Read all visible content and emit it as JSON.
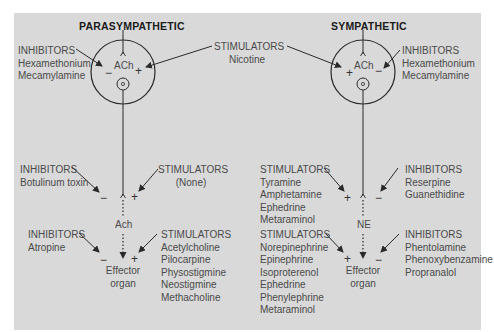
{
  "colors": {
    "panel": "#d9d9d9",
    "line": "#2a2a2a",
    "text": "#4a4a4a",
    "title": "#1a1a1a"
  },
  "parasympathetic": {
    "title": "PARASYMPATHETIC",
    "ganglion": {
      "transmitter": "ACh",
      "inhibitors": {
        "label": "INHIBITORS",
        "items": [
          "Hexamethonium",
          "Mecamylamine"
        ],
        "sign": "−"
      },
      "stimulator_sign": "+"
    },
    "postganglionic": {
      "inhibitors": {
        "label": "INHIBITORS",
        "items": [
          "Botulinum toxin"
        ],
        "sign": "−"
      },
      "stimulators": {
        "label": "STIMULATORS",
        "items": [
          "(None)"
        ],
        "sign": "+"
      },
      "transmitter": "Ach"
    },
    "effector": {
      "label_line1": "Effector",
      "label_line2": "organ",
      "inhibitors": {
        "label": "INHIBITORS",
        "items": [
          "Atropine"
        ],
        "sign": "−"
      },
      "stimulators": {
        "label": "STIMULATORS",
        "items": [
          "Acetylcholine",
          "Pilocarpine",
          "Physostigmine",
          "Neostigmine",
          "Methacholine"
        ],
        "sign": "+"
      }
    }
  },
  "shared_ganglion_stimulators": {
    "label": "STIMULATORS",
    "items": [
      "Nicotine"
    ]
  },
  "sympathetic": {
    "title": "SYMPATHETIC",
    "ganglion": {
      "transmitter": "ACh",
      "inhibitors": {
        "label": "INHIBITORS",
        "items": [
          "Hexamethonium",
          "Mecamylamine"
        ],
        "sign": "−"
      },
      "stimulator_sign": "+"
    },
    "postganglionic": {
      "stimulators": {
        "label": "STIMULATORS",
        "items": [
          "Tyramine",
          "Amphetamine",
          "Ephedrine",
          "Metaraminol"
        ],
        "sign": "+"
      },
      "inhibitors": {
        "label": "INHIBITORS",
        "items": [
          "Reserpine",
          "Guanethidine"
        ],
        "sign": "−"
      },
      "transmitter": "NE"
    },
    "effector": {
      "label_line1": "Effector",
      "label_line2": "organ",
      "stimulators": {
        "label": "STIMULATORS",
        "items": [
          "Norepinephrine",
          "Epinephrine",
          "Isoproterenol",
          "Ephedrine",
          "Phenylephrine",
          "Metaraminol"
        ],
        "sign": "+"
      },
      "inhibitors": {
        "label": "INHIBITORS",
        "items": [
          "Phentolamine",
          "Phenoxybenzamine",
          "Propranalol"
        ],
        "sign": "−"
      }
    }
  }
}
